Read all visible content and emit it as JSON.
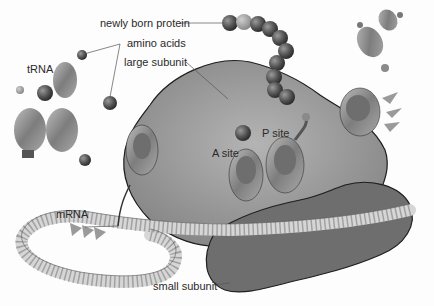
{
  "diagram": {
    "labels": {
      "protein": "newly born protein",
      "amino": "amino acids",
      "large": "large subunit",
      "trna": "tRNA",
      "asite": "A site",
      "psite": "P site",
      "mrna": "mRNA",
      "small": "small subunit"
    },
    "colors": {
      "large_subunit": "#8f8f8f",
      "small_subunit": "#6e6e6e",
      "mrna": "#d9d9d9",
      "bead": "#5a5a5a",
      "outline": "#1e1e1e",
      "text": "#2a2a2a"
    }
  }
}
